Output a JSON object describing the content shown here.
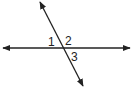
{
  "diagram": {
    "type": "intersecting-lines",
    "lines": [
      {
        "name": "horizontal-line",
        "arrows": "both"
      },
      {
        "name": "transversal-line",
        "arrows": "both"
      }
    ],
    "angle_labels": [
      "1",
      "2",
      "3"
    ],
    "stroke_color": "#222222"
  }
}
